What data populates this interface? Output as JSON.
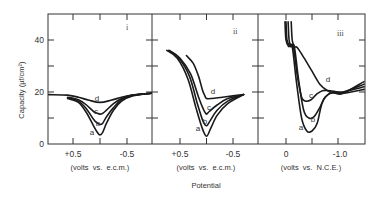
{
  "chart_data": [
    {
      "type": "line",
      "panel": "i",
      "xlabel": "(volts vs. e.c.m.)",
      "x_ticks": [
        "+0.5",
        "-0.5"
      ],
      "x_range": [
        0.95,
        -0.95
      ],
      "ylabel": "Capacity (µf/cm²)",
      "ylim": [
        0,
        50
      ],
      "y_ticks": [
        0,
        20,
        40
      ],
      "series": [
        {
          "name": "a",
          "x": [
            0.6,
            0.4,
            0.25,
            0.12,
            0.05,
            0.0,
            -0.05,
            -0.12,
            -0.25,
            -0.4,
            -0.6,
            -0.95
          ],
          "y": [
            17.5,
            16,
            12,
            7,
            4.5,
            3.5,
            4.5,
            8,
            13,
            16.5,
            18.5,
            19.5
          ]
        },
        {
          "name": "b",
          "x": [
            0.6,
            0.4,
            0.25,
            0.12,
            0.05,
            0.0,
            -0.05,
            -0.12,
            -0.25,
            -0.4,
            -0.6,
            -0.95
          ],
          "y": [
            17.8,
            16.5,
            13.5,
            9.5,
            8,
            7.5,
            8,
            10.5,
            14,
            17,
            18.7,
            19.5
          ]
        },
        {
          "name": "c",
          "x": [
            0.6,
            0.4,
            0.25,
            0.12,
            0.05,
            0.0,
            -0.05,
            -0.12,
            -0.25,
            -0.4,
            -0.6,
            -0.95
          ],
          "y": [
            18,
            17,
            15,
            12.5,
            11.8,
            11.5,
            11.8,
            13,
            15.5,
            17.5,
            18.8,
            19.5
          ]
        },
        {
          "name": "d",
          "x": [
            0.95,
            0.6,
            0.4,
            0.2,
            0.0,
            -0.2,
            -0.4,
            -0.6,
            -0.95
          ],
          "y": [
            19,
            18.8,
            18,
            16.8,
            16,
            16.8,
            18,
            18.8,
            19.5
          ]
        }
      ]
    },
    {
      "type": "line",
      "panel": "ii",
      "xlabel": "(volts vs. e.c.m.)",
      "x_ticks": [
        "+0.5",
        "-0.5"
      ],
      "x_range": [
        1.0,
        -1.0
      ],
      "ylim": [
        0,
        50
      ],
      "series": [
        {
          "name": "a",
          "x": [
            0.75,
            0.55,
            0.35,
            0.2,
            0.08,
            0.0,
            -0.08,
            -0.2,
            -0.4,
            -0.7
          ],
          "y": [
            36,
            33,
            25,
            14,
            6,
            3,
            6,
            11,
            15.5,
            19
          ]
        },
        {
          "name": "b",
          "x": [
            0.72,
            0.52,
            0.32,
            0.18,
            0.07,
            0.0,
            -0.07,
            -0.2,
            -0.4,
            -0.7
          ],
          "y": [
            36,
            33,
            26,
            16,
            9,
            7,
            9,
            13,
            16.5,
            19
          ]
        },
        {
          "name": "c",
          "x": [
            0.7,
            0.5,
            0.3,
            0.15,
            0.05,
            0.0,
            -0.05,
            -0.2,
            -0.4,
            -0.7
          ],
          "y": [
            36,
            33,
            27,
            18,
            13,
            11.5,
            12.5,
            15,
            17.5,
            19
          ]
        },
        {
          "name": "d",
          "x": [
            0.38,
            0.25,
            0.15,
            0.08,
            0.03,
            0.0,
            -0.1,
            -0.3,
            -0.5,
            -0.7
          ],
          "y": [
            34,
            31,
            26,
            21,
            18.5,
            17.5,
            17.5,
            18,
            18.5,
            19
          ]
        }
      ]
    },
    {
      "type": "line",
      "panel": "iii",
      "xlabel": "(volts vs. N.C.E.)",
      "x_ticks": [
        "0",
        "-1.0"
      ],
      "x_range": [
        0.5,
        -1.5
      ],
      "ylim": [
        0,
        50
      ],
      "series": [
        {
          "name": "a",
          "x": [
            0.02,
            0.0,
            -0.05,
            -0.12,
            -0.2,
            -0.3,
            -0.4,
            -0.5,
            -0.6,
            -0.7,
            -0.85,
            -1.1,
            -1.5
          ],
          "y": [
            47,
            40,
            37.5,
            37.5,
            24,
            10,
            5,
            5,
            8,
            16,
            19.5,
            19.5,
            21
          ]
        },
        {
          "name": "b",
          "x": [
            -0.04,
            -0.06,
            -0.1,
            -0.16,
            -0.24,
            -0.34,
            -0.44,
            -0.54,
            -0.65,
            -0.75,
            -0.9,
            -1.1,
            -1.5
          ],
          "y": [
            47,
            40,
            37.5,
            37.5,
            25,
            13,
            10,
            10.5,
            14,
            18,
            20,
            20,
            22
          ]
        },
        {
          "name": "c",
          "x": [
            0.0,
            -0.02,
            -0.08,
            -0.14,
            -0.22,
            -0.3,
            -0.38,
            -0.48,
            -0.58,
            -0.7,
            -0.85,
            -1.1,
            -1.5
          ],
          "y": [
            47,
            40,
            37.5,
            37.5,
            26,
            18,
            16.5,
            17,
            19,
            20.5,
            20.5,
            20,
            23
          ]
        },
        {
          "name": "d",
          "x": [
            -0.1,
            -0.12,
            -0.16,
            -0.22,
            -0.35,
            -0.5,
            -0.65,
            -0.8,
            -0.95,
            -1.1,
            -1.5
          ],
          "y": [
            47,
            40,
            37.5,
            37,
            33,
            28,
            23,
            20.5,
            19.5,
            19.5,
            24
          ]
        }
      ]
    }
  ],
  "chart": {
    "ylabel": "Capacity (µf/cm²)",
    "xlabel": "Potential",
    "y_tick_labels": [
      "0",
      "20",
      "40"
    ],
    "panels": [
      {
        "label": "i",
        "tick_left": "+0.5",
        "tick_right": "-0.5",
        "axis_caption": "(volts  vs.  e.c.m.)"
      },
      {
        "label": "ii",
        "tick_left": "+0.5",
        "tick_right": "-0.5",
        "axis_caption": "(volts  vs.  e.c.m.)"
      },
      {
        "label": "iii",
        "tick_left": "0",
        "tick_right": "-1.0",
        "axis_caption": "(volts  vs.  N.C.E.)"
      }
    ],
    "curve_labels": {
      "i": [
        {
          "t": "a",
          "x": 92,
          "y": 135
        },
        {
          "t": "b",
          "x": 98,
          "y": 126
        },
        {
          "t": "c",
          "x": 96,
          "y": 114
        },
        {
          "t": "d",
          "x": 97,
          "y": 101
        }
      ],
      "ii": [
        {
          "t": "a",
          "x": 198,
          "y": 131
        },
        {
          "t": "b",
          "x": 205,
          "y": 124
        },
        {
          "t": "c",
          "x": 209,
          "y": 110
        },
        {
          "t": "d",
          "x": 213,
          "y": 94
        }
      ],
      "iii": [
        {
          "t": "a",
          "x": 301,
          "y": 130
        },
        {
          "t": "b",
          "x": 313,
          "y": 122
        },
        {
          "t": "c",
          "x": 311,
          "y": 98
        },
        {
          "t": "d",
          "x": 328,
          "y": 82
        }
      ]
    }
  }
}
